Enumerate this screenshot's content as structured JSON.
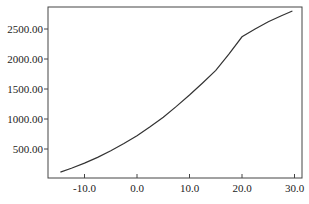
{
  "chart_data": {
    "type": "line",
    "title": "",
    "xlabel": "",
    "ylabel": "",
    "xlim": [
      -16.5,
      31.5
    ],
    "ylim": [
      0,
      2870
    ],
    "grid": false,
    "legend": null,
    "x_ticks": [
      -10,
      0,
      10,
      20,
      30
    ],
    "x_tick_labels": [
      "-10.0",
      "0.0",
      "10.0",
      "20.0",
      "30.0"
    ],
    "y_ticks": [
      500,
      1000,
      1500,
      2000,
      2500
    ],
    "y_tick_labels": [
      "500.00",
      "1000.00",
      "1500.00",
      "2000.00",
      "2500.00"
    ],
    "series": [
      {
        "name": "curve",
        "color": "#333333",
        "x": [
          -14.6,
          -12.5,
          -10,
          -7.5,
          -5,
          -2.5,
          0,
          2.5,
          5,
          7.5,
          10,
          12.5,
          15,
          17.5,
          20,
          22.5,
          25,
          27.5,
          29.6
        ],
        "y": [
          115,
          180,
          265,
          360,
          470,
          590,
          720,
          870,
          1030,
          1210,
          1400,
          1600,
          1810,
          2080,
          2370,
          2500,
          2620,
          2720,
          2800
        ]
      }
    ]
  }
}
